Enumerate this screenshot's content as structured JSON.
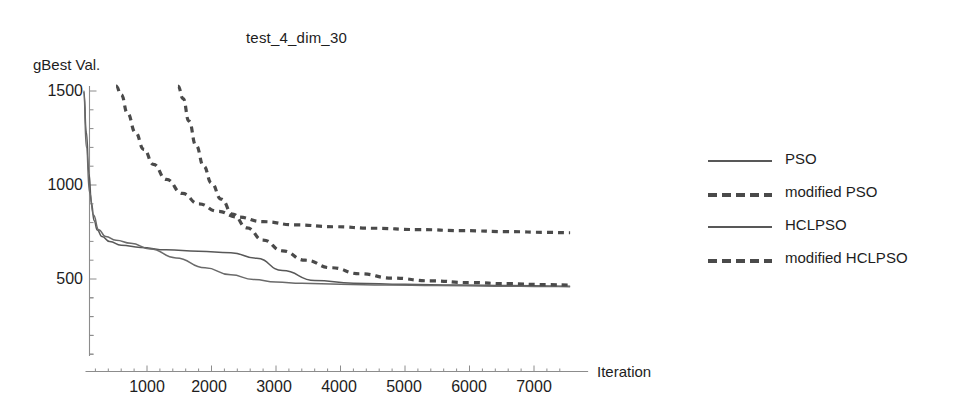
{
  "chart_data": {
    "type": "line",
    "title": "test_4_dim_30",
    "xlabel": "Iteration",
    "ylabel": "gBest Val.",
    "xlim": [
      0,
      7600
    ],
    "ylim": [
      0,
      1560
    ],
    "xticks": [
      1000,
      2000,
      3000,
      4000,
      5000,
      6000,
      7000
    ],
    "xtick_labels": [
      "1000",
      "2000",
      "3000",
      "4000",
      "5000",
      "6000",
      "7000"
    ],
    "yticks": [
      500,
      1000,
      1500
    ],
    "ytick_labels": [
      "500",
      "1000",
      "1500"
    ],
    "grid": false,
    "legend_position": "right",
    "series": [
      {
        "name": "PSO",
        "style": "solid",
        "color": "#585858",
        "x": [
          20,
          60,
          100,
          140,
          180,
          230,
          300,
          420,
          600,
          900,
          1300,
          1800,
          2300,
          2700,
          3100,
          3600,
          4200,
          5000,
          5800,
          6600,
          7400,
          7560
        ],
        "y": [
          1500,
          1280,
          1060,
          900,
          810,
          760,
          726,
          700,
          680,
          668,
          655,
          648,
          640,
          610,
          545,
          492,
          478,
          472,
          468,
          465,
          462,
          461
        ]
      },
      {
        "name": "modified PSO",
        "style": "dashed",
        "color": "#4a4a4a",
        "x": [
          520,
          600,
          700,
          820,
          950,
          1100,
          1300,
          1550,
          1800,
          2100,
          2400,
          2800,
          3300,
          3900,
          4500,
          5200,
          5900,
          6600,
          7200,
          7560
        ],
        "y": [
          1560,
          1480,
          1380,
          1280,
          1190,
          1110,
          1030,
          955,
          900,
          860,
          830,
          805,
          788,
          778,
          770,
          763,
          757,
          752,
          748,
          746
        ]
      },
      {
        "name": "HCLPSO",
        "style": "solid",
        "color": "#6a6a6a",
        "x": [
          20,
          60,
          110,
          170,
          250,
          360,
          520,
          750,
          1050,
          1450,
          1900,
          2300,
          2650,
          3000,
          3400,
          4000,
          4700,
          5500,
          6400,
          7200,
          7560
        ],
        "y": [
          1500,
          1200,
          960,
          840,
          762,
          726,
          706,
          690,
          660,
          612,
          560,
          522,
          498,
          484,
          477,
          472,
          468,
          465,
          462,
          460,
          459
        ]
      },
      {
        "name": "modified HCLPSO",
        "style": "dashed",
        "color": "#4a4a4a",
        "x": [
          1480,
          1560,
          1650,
          1760,
          1880,
          2000,
          2150,
          2330,
          2550,
          2800,
          3100,
          3450,
          3850,
          4300,
          4800,
          5400,
          6000,
          6600,
          7200,
          7560
        ],
        "y": [
          1560,
          1460,
          1340,
          1210,
          1100,
          1010,
          925,
          845,
          772,
          707,
          650,
          600,
          560,
          528,
          505,
          490,
          481,
          475,
          470,
          468
        ]
      }
    ]
  },
  "legend": {
    "entries": [
      {
        "label": "PSO",
        "style": "solid"
      },
      {
        "label": "modified PSO",
        "style": "dashed"
      },
      {
        "label": "HCLPSO",
        "style": "solid"
      },
      {
        "label": "modified HCLPSO",
        "style": "dashed"
      }
    ]
  },
  "colors": {
    "axis": "#8c8c8c",
    "solid_series": "#585858",
    "dashed_series": "#4a4a4a",
    "text": "#1d1d1d",
    "background": "#ffffff"
  }
}
